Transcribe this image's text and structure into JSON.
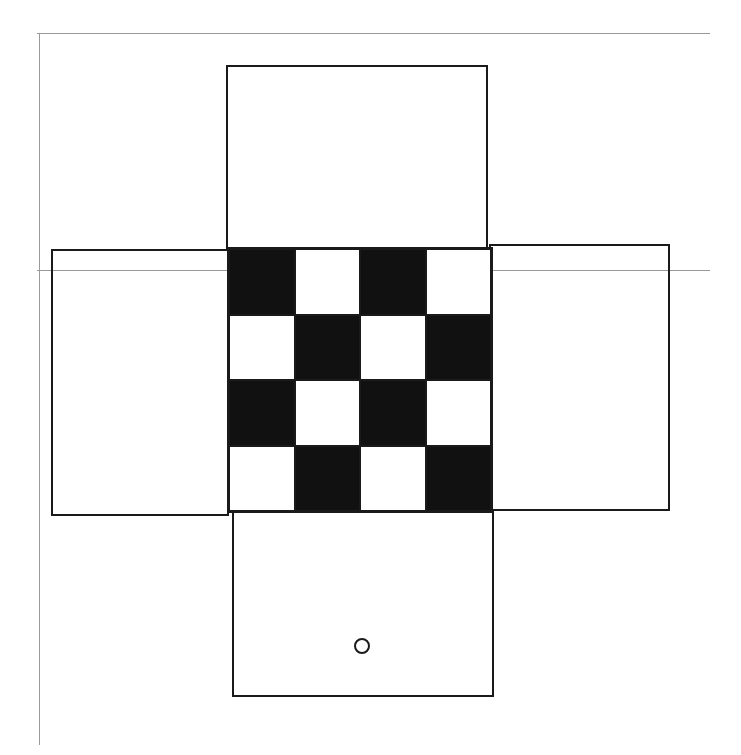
{
  "diagram": {
    "type": "cube-net",
    "colors": {
      "line": "#1a1a1a",
      "fill_black": "#111111",
      "fill_white": "#ffffff",
      "guide_line": "#9a9a9a"
    },
    "guides": [
      {
        "orientation": "horizontal",
        "x1": 37,
        "x2": 710,
        "y": 33
      },
      {
        "orientation": "horizontal",
        "x1": 37,
        "x2": 710,
        "y": 270
      },
      {
        "orientation": "vertical",
        "x": 39,
        "y1": 33,
        "y2": 745
      }
    ],
    "faces": [
      {
        "name": "top",
        "x": 226,
        "y": 65,
        "w": 262,
        "h": 184
      },
      {
        "name": "left",
        "x": 51,
        "y": 249,
        "w": 178,
        "h": 267
      },
      {
        "name": "right",
        "x": 489,
        "y": 244,
        "w": 181,
        "h": 267
      },
      {
        "name": "bottom",
        "x": 232,
        "y": 511,
        "w": 262,
        "h": 186
      }
    ],
    "center_face": {
      "name": "center-checkerboard",
      "x": 227,
      "y": 247,
      "w": 266,
      "h": 266,
      "rows": 4,
      "cols": 4,
      "pattern": [
        [
          "black",
          "white",
          "black",
          "white"
        ],
        [
          "white",
          "black",
          "white",
          "black"
        ],
        [
          "black",
          "white",
          "black",
          "white"
        ],
        [
          "white",
          "black",
          "white",
          "black"
        ]
      ]
    },
    "marker": {
      "shape": "circle",
      "face": "bottom",
      "cx": 362,
      "cy": 646,
      "r": 8
    }
  }
}
